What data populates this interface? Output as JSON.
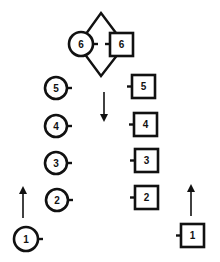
{
  "diagram": {
    "type": "pedigree-style pairing diagram",
    "colors": {
      "stroke": "#111111",
      "background": "#ffffff"
    },
    "top_pair": {
      "circle": {
        "label": "6",
        "cx": 81,
        "cy": 44,
        "r": 12
      },
      "square": {
        "label": "6",
        "x": 110,
        "y": 33,
        "w": 23,
        "h": 23
      },
      "diamond": {
        "top": [
          101,
          13
        ],
        "right": [
          125,
          45
        ],
        "bottom": [
          101,
          76
        ],
        "left": [
          78,
          45
        ]
      },
      "connector": "dashed"
    },
    "circles": [
      {
        "label": "5",
        "cx": 56,
        "cy": 88,
        "r": 11
      },
      {
        "label": "4",
        "cx": 56,
        "cy": 126,
        "r": 11
      },
      {
        "label": "3",
        "cx": 56,
        "cy": 163,
        "r": 11
      },
      {
        "label": "2",
        "cx": 57,
        "cy": 200,
        "r": 11
      },
      {
        "label": "1",
        "cx": 26,
        "cy": 239,
        "r": 12
      }
    ],
    "squares": [
      {
        "label": "5",
        "x": 132,
        "y": 75,
        "w": 23,
        "h": 23
      },
      {
        "label": "4",
        "x": 134,
        "y": 113,
        "w": 23,
        "h": 23
      },
      {
        "label": "3",
        "x": 135,
        "y": 149,
        "w": 23,
        "h": 23
      },
      {
        "label": "2",
        "x": 135,
        "y": 186,
        "w": 23,
        "h": 23
      },
      {
        "label": "1",
        "x": 181,
        "y": 224,
        "w": 23,
        "h": 23
      }
    ],
    "arrows": [
      {
        "name": "down-arrow-center",
        "direction": "down",
        "x": 104,
        "y_from": 92,
        "y_to": 122
      },
      {
        "name": "up-arrow-left",
        "direction": "up",
        "x": 23,
        "y_from": 218,
        "y_to": 186
      },
      {
        "name": "up-arrow-right",
        "direction": "up",
        "x": 191,
        "y_from": 216,
        "y_to": 184
      }
    ]
  }
}
